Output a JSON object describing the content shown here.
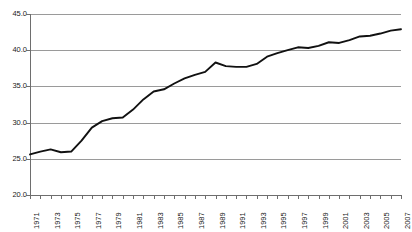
{
  "chart_data": {
    "type": "line",
    "title": "",
    "subtitle": "",
    "xlabel": "",
    "ylabel": "",
    "grid": true,
    "legend": false,
    "legend_position": "none",
    "line_color": "#111111",
    "grid_color": "#9a9a9a",
    "axis_color": "#6e6e6e",
    "ylim": [
      20.0,
      45.0
    ],
    "ytick_labels": [
      "45.0",
      "40.0",
      "35.0",
      "30.0",
      "25.0",
      "20.0"
    ],
    "ytick_values": [
      45.0,
      40.0,
      35.0,
      30.0,
      25.0,
      20.0
    ],
    "xlim": [
      1971,
      2007
    ],
    "xtick_labels": [
      "1971",
      "1973",
      "1975",
      "1977",
      "1979",
      "1981",
      "1983",
      "1985",
      "1987",
      "1989",
      "1991",
      "1993",
      "1995",
      "1997",
      "1999",
      "2001",
      "2003",
      "2005",
      "2007"
    ],
    "x": [
      1971,
      1972,
      1973,
      1974,
      1975,
      1976,
      1977,
      1978,
      1979,
      1980,
      1981,
      1982,
      1983,
      1984,
      1985,
      1986,
      1987,
      1988,
      1989,
      1990,
      1991,
      1992,
      1993,
      1994,
      1995,
      1996,
      1997,
      1998,
      1999,
      2000,
      2001,
      2002,
      2003,
      2004,
      2005,
      2006,
      2007
    ],
    "values": [
      25.6,
      26.0,
      26.3,
      25.9,
      26.0,
      27.5,
      29.3,
      30.2,
      30.6,
      30.7,
      31.8,
      33.2,
      34.3,
      34.6,
      35.4,
      36.1,
      36.6,
      37.0,
      38.3,
      37.8,
      37.7,
      37.7,
      38.1,
      39.1,
      39.6,
      40.0,
      40.4,
      40.3,
      40.6,
      41.1,
      41.0,
      41.4,
      41.9,
      42.0,
      42.3,
      42.7,
      42.9
    ]
  }
}
